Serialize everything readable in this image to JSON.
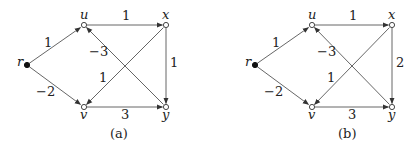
{
  "graphs": [
    {
      "id": "a",
      "caption": "(a)",
      "nodes": {
        "r": {
          "label": "r",
          "x": 27,
          "y": 65,
          "filled": true
        },
        "u": {
          "label": "u",
          "x": 84,
          "y": 25,
          "filled": false
        },
        "x": {
          "label": "x",
          "x": 166,
          "y": 25,
          "filled": false
        },
        "v": {
          "label": "v",
          "x": 84,
          "y": 107,
          "filled": false
        },
        "y": {
          "label": "y",
          "x": 166,
          "y": 107,
          "filled": false
        }
      },
      "edges": [
        {
          "from": "r",
          "to": "u",
          "weight": "1"
        },
        {
          "from": "r",
          "to": "v",
          "weight": "−2"
        },
        {
          "from": "u",
          "to": "x",
          "weight": "1"
        },
        {
          "from": "y",
          "to": "u",
          "weight": "−3"
        },
        {
          "from": "x",
          "to": "v",
          "weight": "1"
        },
        {
          "from": "x",
          "to": "y",
          "weight": "1"
        },
        {
          "from": "v",
          "to": "y",
          "weight": "3"
        }
      ]
    },
    {
      "id": "b",
      "caption": "(b)",
      "nodes": {
        "r": {
          "label": "r",
          "x": 255,
          "y": 65,
          "filled": true
        },
        "u": {
          "label": "u",
          "x": 312,
          "y": 25,
          "filled": false
        },
        "x": {
          "label": "x",
          "x": 392,
          "y": 25,
          "filled": false
        },
        "v": {
          "label": "v",
          "x": 312,
          "y": 107,
          "filled": false
        },
        "y": {
          "label": "y",
          "x": 392,
          "y": 107,
          "filled": false
        }
      },
      "edges": [
        {
          "from": "r",
          "to": "u",
          "weight": "1"
        },
        {
          "from": "r",
          "to": "v",
          "weight": "−2"
        },
        {
          "from": "u",
          "to": "x",
          "weight": "1"
        },
        {
          "from": "y",
          "to": "u",
          "weight": "−3"
        },
        {
          "from": "x",
          "to": "v",
          "weight": "1"
        },
        {
          "from": "x",
          "to": "y",
          "weight": "2"
        },
        {
          "from": "v",
          "to": "y",
          "weight": "3"
        }
      ]
    }
  ]
}
